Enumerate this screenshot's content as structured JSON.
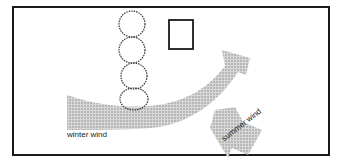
{
  "diagram": {
    "type": "site-plan wind diagram",
    "elements": {
      "building": "small square structure",
      "trees": "row of 4 shrubs/trees acting as windbreak",
      "winter_wind_arrow": "large curved shaded arrow deflected upward around the tree row",
      "summer_wind_arrow": "shaded arrow coming from lower right pointing up-left"
    },
    "labels": {
      "winter_wind": "winter wind",
      "summer_wind": "summer wind"
    },
    "colors": {
      "frame": "#1a1a1a",
      "arrow_fill": "#b8b8b8",
      "line": "#222222"
    }
  }
}
